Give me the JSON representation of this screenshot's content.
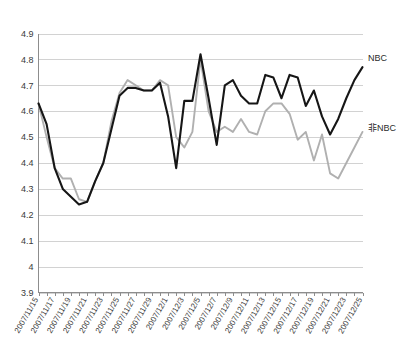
{
  "chart_data": {
    "type": "line",
    "title": "",
    "subtitle": "",
    "xlabel": "",
    "ylabel": "",
    "ylim": [
      3.9,
      4.9
    ],
    "grid": true,
    "legend_position": "right",
    "ytick_labels": [
      "4.9",
      "4.8",
      "4.7",
      "4.6",
      "4.5",
      "4.4",
      "4.3",
      "4.2",
      "4.1",
      "4",
      "3.9"
    ],
    "ytick_values": [
      4.9,
      4.8,
      4.7,
      4.6,
      4.5,
      4.4,
      4.3,
      4.2,
      4.1,
      4.0,
      3.9
    ],
    "xtick_labels": [
      "2007/11/15",
      "2007/11/17",
      "2007/11/19",
      "2007/11/21",
      "2007/11/23",
      "2007/11/25",
      "2007/11/27",
      "2007/11/29",
      "2007/12/1",
      "2007/12/3",
      "2007/12/5",
      "2007/12/7",
      "2007/12/9",
      "2007/12/11",
      "2007/12/13",
      "2007/12/15",
      "2007/12/17",
      "2007/12/19",
      "2007/12/21",
      "2007/12/23",
      "2007/12/25"
    ],
    "x": [
      "2007/11/15",
      "2007/11/16",
      "2007/11/17",
      "2007/11/18",
      "2007/11/19",
      "2007/11/20",
      "2007/11/21",
      "2007/11/22",
      "2007/11/23",
      "2007/11/24",
      "2007/11/25",
      "2007/11/26",
      "2007/11/27",
      "2007/11/28",
      "2007/11/29",
      "2007/11/30",
      "2007/12/1",
      "2007/12/2",
      "2007/12/3",
      "2007/12/4",
      "2007/12/5",
      "2007/12/6",
      "2007/12/7",
      "2007/12/8",
      "2007/12/9",
      "2007/12/10",
      "2007/12/11",
      "2007/12/12",
      "2007/12/13",
      "2007/12/14",
      "2007/12/15",
      "2007/12/16",
      "2007/12/17",
      "2007/12/18",
      "2007/12/19",
      "2007/12/20",
      "2007/12/21",
      "2007/12/22",
      "2007/12/23",
      "2007/12/24",
      "2007/12/25"
    ],
    "series": [
      {
        "name": "NBC",
        "color": "#161616",
        "width": 2.1,
        "values": [
          4.63,
          4.55,
          4.38,
          4.3,
          4.27,
          4.24,
          4.25,
          4.33,
          4.4,
          4.53,
          4.66,
          4.69,
          4.69,
          4.68,
          4.68,
          4.71,
          4.58,
          4.38,
          4.64,
          4.64,
          4.82,
          4.65,
          4.47,
          4.7,
          4.72,
          4.66,
          4.63,
          4.63,
          4.74,
          4.73,
          4.65,
          4.74,
          4.73,
          4.62,
          4.68,
          4.58,
          4.51,
          4.57,
          4.65,
          4.72,
          4.77
        ]
      },
      {
        "name": "非NBC",
        "color": "#b0b0b0",
        "width": 1.9,
        "values": [
          4.63,
          4.5,
          4.38,
          4.34,
          4.34,
          4.26,
          4.25,
          4.33,
          4.4,
          4.56,
          4.67,
          4.72,
          4.7,
          4.68,
          4.68,
          4.72,
          4.7,
          4.5,
          4.46,
          4.52,
          4.8,
          4.6,
          4.52,
          4.54,
          4.52,
          4.57,
          4.52,
          4.51,
          4.6,
          4.63,
          4.63,
          4.59,
          4.49,
          4.52,
          4.41,
          4.51,
          4.36,
          4.34,
          4.4,
          4.46,
          4.52
        ]
      }
    ],
    "legend_entries": [
      {
        "label": "NBC",
        "color": "#161616"
      },
      {
        "label": "非NBC",
        "color": "#b0b0b0"
      }
    ]
  }
}
